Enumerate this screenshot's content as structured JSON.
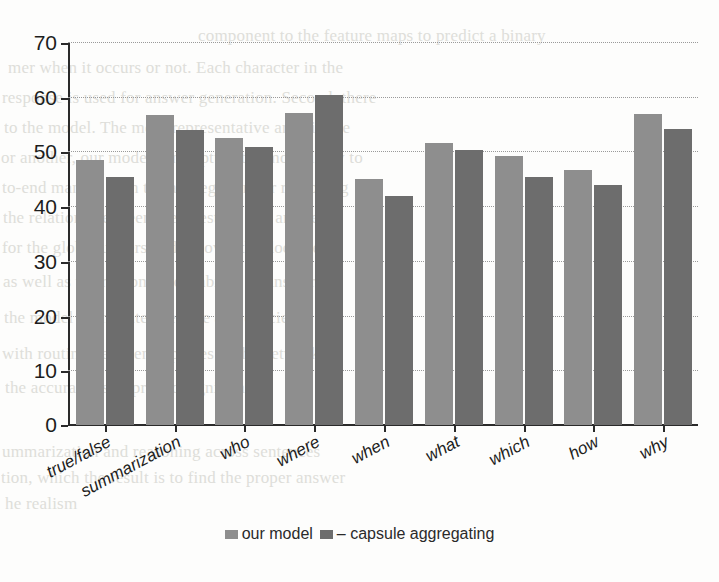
{
  "chart_data": {
    "type": "bar",
    "title": "",
    "xlabel": "",
    "ylabel": "",
    "ylim": [
      0,
      70
    ],
    "ytick_step": 10,
    "yticks": [
      "0",
      "10",
      "20",
      "30",
      "40",
      "50",
      "60",
      "70"
    ],
    "grid": true,
    "grid_style": "dotted-horizontal",
    "legend_position": "bottom-center",
    "categories": [
      "true/false",
      "summarization",
      "who",
      "where",
      "when",
      "what",
      "which",
      "how",
      "why"
    ],
    "series": [
      {
        "name": "our model",
        "color": "#8e8e8e",
        "values": [
          48.4,
          56.6,
          52.5,
          57.1,
          44.9,
          51.6,
          49.2,
          46.6,
          56.9
        ]
      },
      {
        "name": "– capsule aggregating",
        "color": "#6d6d6d",
        "values": [
          45.3,
          54.0,
          50.9,
          60.4,
          41.8,
          50.3,
          45.3,
          43.8,
          54.1
        ]
      }
    ]
  },
  "legend": {
    "entries": [
      {
        "label": "our model",
        "swatch": "legend-swatch-our-model"
      },
      {
        "label": "– capsule aggregating",
        "swatch": "legend-swatch-capsule-aggregating"
      }
    ]
  },
  "background_text": {
    "lines": [
      {
        "text": "component to the feature maps to predict a binary",
        "x": 198,
        "y": 26
      },
      {
        "text": "mer when it occurs or not. Each character in the",
        "x": 8,
        "y": 58
      },
      {
        "text": "response is used for answer generation. Second, there",
        "x": 2,
        "y": 88
      },
      {
        "text": "to the model. The more representative and simple",
        "x": 4,
        "y": 118
      },
      {
        "text": "or another, our model can capture the most likely to",
        "x": 1,
        "y": 148
      },
      {
        "text": "to-end manner with the aggregation for reasoning",
        "x": 2,
        "y": 178
      },
      {
        "text": "the relations between the question and answer",
        "x": 3,
        "y": 208
      },
      {
        "text": "for the global understanding over the document",
        "x": 2,
        "y": 238
      },
      {
        "text": "as well as the reasoning capability of answering",
        "x": 3,
        "y": 272
      },
      {
        "text": "the model in the interpretable and efficient",
        "x": 4,
        "y": 308
      },
      {
        "text": "with routing between capsules in the network",
        "x": 2,
        "y": 344
      },
      {
        "text": "the accuracy is improved significantly",
        "x": 5,
        "y": 378
      },
      {
        "text": "ummarization and reasoning across sentences",
        "x": 2,
        "y": 442
      },
      {
        "text": "tion, which the result is to find the proper answer",
        "x": 1,
        "y": 468
      },
      {
        "text": "he realism",
        "x": 5,
        "y": 494
      }
    ]
  }
}
